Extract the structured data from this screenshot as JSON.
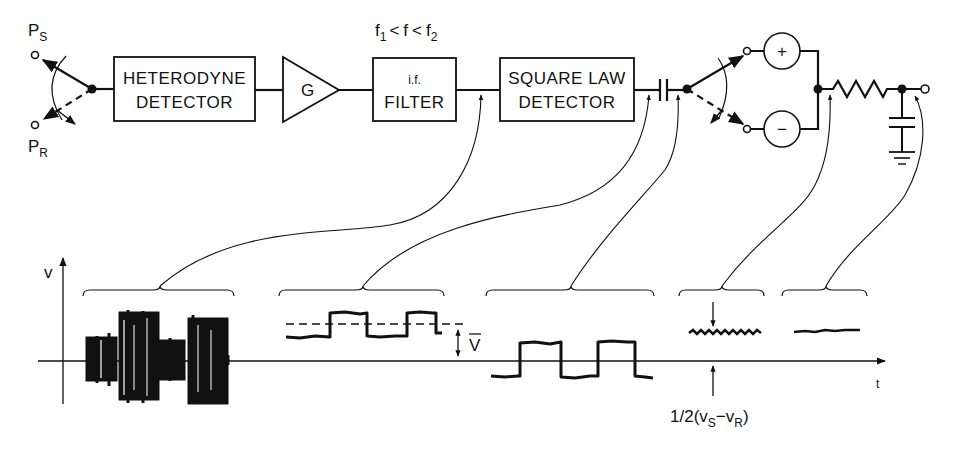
{
  "diagram": {
    "colors": {
      "ink": "#111111",
      "background": "#ffffff"
    },
    "inputs": {
      "signal": {
        "label": "P",
        "subscript": "S"
      },
      "reference": {
        "label": "P",
        "subscript": "R"
      }
    },
    "blocks": [
      {
        "id": "heterodyne",
        "line1": "HETERODYNE",
        "line2": "DETECTOR"
      },
      {
        "id": "amplifier",
        "label": "G"
      },
      {
        "id": "if-filter",
        "line1": "i.f.",
        "line2": "FILTER",
        "annotation": {
          "f1": "f",
          "f1_sub": "1",
          "lt1": "<",
          "f": "f",
          "lt2": "<",
          "f2": "f",
          "f2_sub": "2"
        }
      },
      {
        "id": "square-law",
        "line1": "SQUARE LAW",
        "line2": "DETECTOR"
      },
      {
        "id": "dc-block-capacitor",
        "label": ""
      },
      {
        "id": "sync-switch",
        "label": ""
      },
      {
        "id": "plus-channel",
        "label": "+"
      },
      {
        "id": "minus-channel",
        "label": "−"
      },
      {
        "id": "rc-integrator",
        "label": ""
      }
    ],
    "graph": {
      "y_axis_label": "v",
      "x_axis_label": "t",
      "vbar_label": "V",
      "difference_label": {
        "prefix": "1/2(v",
        "s_sub": "S",
        "minus": "−v",
        "r_sub": "R",
        "suffix": ")"
      }
    },
    "waveforms": [
      {
        "id": "if-output",
        "description": "noisy i.f. signal, amplitude alternates between P_S and P_R",
        "probe": "after i.f. filter"
      },
      {
        "id": "square-law-output",
        "description": "rectified square wave with DC level V̄",
        "probe": "after square-law detector"
      },
      {
        "id": "ac-coupled",
        "description": "zero-mean square wave after DC blocking capacitor",
        "probe": "after capacitor"
      },
      {
        "id": "synchronous-output",
        "description": "demodulated level 1/2(v_S − v_R) with ripple",
        "probe": "after synchronous switch"
      },
      {
        "id": "integrated-output",
        "description": "smoothed DC output",
        "probe": "after RC integrator"
      }
    ]
  }
}
